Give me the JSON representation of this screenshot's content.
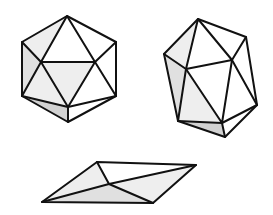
{
  "figure": {
    "colors": {
      "background": "#ffffff",
      "edge": "#111111",
      "face_white": "#ffffff",
      "face_light": "#eeeeee",
      "face_mid": "#e0e0e0",
      "face_dark": "#d2d2d2"
    },
    "shapes": [
      {
        "name": "icosahedron-front-view"
      },
      {
        "name": "icosahedron-tilted-view"
      },
      {
        "name": "icosahedron-flattened-view"
      }
    ]
  }
}
